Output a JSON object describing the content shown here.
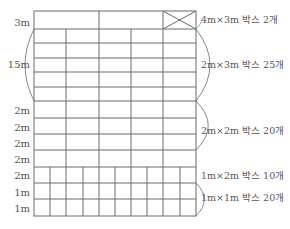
{
  "colors": {
    "line": "#6a6a6a",
    "text": "#555555",
    "background": "#ffffff"
  },
  "grid": {
    "left": 34,
    "right": 196,
    "top": 11,
    "bottom": 216,
    "horizontal_lines": [
      29,
      43,
      58,
      72,
      87,
      101,
      118,
      134,
      150,
      167,
      183,
      199
    ],
    "vertical_segments": [
      {
        "x": 99,
        "y1": 11,
        "y2": 29
      },
      {
        "x": 163,
        "y1": 11,
        "y2": 29
      },
      {
        "x": 66,
        "y1": 29,
        "y2": 167
      },
      {
        "x": 99,
        "y1": 29,
        "y2": 167
      },
      {
        "x": 131,
        "y1": 29,
        "y2": 167
      },
      {
        "x": 163,
        "y1": 29,
        "y2": 167
      },
      {
        "x": 50,
        "y1": 167,
        "y2": 216
      },
      {
        "x": 66,
        "y1": 167,
        "y2": 216
      },
      {
        "x": 83,
        "y1": 167,
        "y2": 216
      },
      {
        "x": 99,
        "y1": 167,
        "y2": 216
      },
      {
        "x": 115,
        "y1": 167,
        "y2": 216
      },
      {
        "x": 131,
        "y1": 167,
        "y2": 216
      },
      {
        "x": 147,
        "y1": 167,
        "y2": 216
      },
      {
        "x": 163,
        "y1": 167,
        "y2": 216
      },
      {
        "x": 180,
        "y1": 167,
        "y2": 216
      }
    ],
    "crossed_box": {
      "x1": 163,
      "y1": 11,
      "x2": 196,
      "y2": 29
    }
  },
  "left_labels": [
    {
      "text": "3m",
      "y": 23
    },
    {
      "text": "15m",
      "y": 65
    },
    {
      "text": "2m",
      "y": 111
    },
    {
      "text": "2m",
      "y": 128
    },
    {
      "text": "2m",
      "y": 144
    },
    {
      "text": "2m",
      "y": 160
    },
    {
      "text": "2m",
      "y": 176
    },
    {
      "text": "1m",
      "y": 193
    },
    {
      "text": "1m",
      "y": 209
    }
  ],
  "left_bracket": {
    "x": 34,
    "y1": 29,
    "y2": 101
  },
  "right_brackets": [
    {
      "x": 196,
      "y1": 29,
      "y2": 101
    },
    {
      "x": 196,
      "y1": 101,
      "y2": 150
    },
    {
      "x": 196,
      "y1": 183,
      "y2": 216
    }
  ],
  "right_labels": [
    {
      "text": "4m×3m 박스 2개",
      "y": 20
    },
    {
      "text": "2m×3m 박스 25개",
      "y": 65
    },
    {
      "text": "2m×2m 박스 20개",
      "y": 131
    },
    {
      "text": "1m×2m 박스 10개",
      "y": 176
    },
    {
      "text": "1m×1m 박스 20개",
      "y": 198
    }
  ]
}
